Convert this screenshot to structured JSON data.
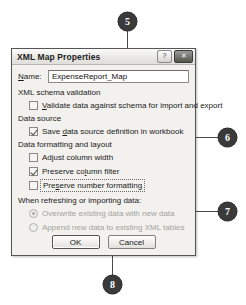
{
  "dialog": {
    "title": "XML Map Properties",
    "titlebar_buttons": [
      {
        "name": "help-button",
        "glyph": "?"
      },
      {
        "name": "close-button",
        "glyph": "✕"
      }
    ],
    "name_field": {
      "label": "Name:",
      "accel": "N",
      "label_rest": "ame:",
      "value": "ExpenseReport_Map",
      "placeholder": "Map name"
    },
    "groups": [
      {
        "label": "XML schema validation",
        "checkboxes": [
          {
            "label": "Validate data against schema for import and export",
            "accel": "V",
            "label_rest": "alidate data against schema for import and export",
            "checked": false,
            "focused": false,
            "disabled": false
          }
        ]
      },
      {
        "label": "Data source",
        "checkboxes": [
          {
            "label": "Save data source definition in workbook",
            "accel": "d",
            "label_pre": "Save ",
            "label_rest": "ata source definition in workbook",
            "checked": true,
            "focused": false,
            "disabled": false
          }
        ]
      },
      {
        "label": "Data formatting and layout",
        "checkboxes": [
          {
            "label": "Adjust column width",
            "accel": "j",
            "label_pre": "Ad",
            "label_rest": "ust column width",
            "checked": false,
            "focused": false,
            "disabled": false
          },
          {
            "label": "Preserve column filter",
            "accel": "l",
            "label_pre": "Preserve co",
            "label_rest": "umn filter",
            "checked": true,
            "focused": false,
            "disabled": false
          },
          {
            "label": "Preserve number formatting",
            "accel": "s",
            "label_pre": "Pre",
            "label_rest": "erve number formatting",
            "checked": false,
            "focused": true,
            "disabled": false
          }
        ]
      }
    ],
    "refresh_group": {
      "label": "When refreshing or importing data:",
      "options": [
        {
          "label": "Overwrite existing data with new data",
          "selected": true,
          "disabled": true
        },
        {
          "label": "Append new data to existing XML tables",
          "selected": false,
          "disabled": true
        }
      ]
    },
    "buttons": [
      {
        "label": "OK",
        "default": true
      },
      {
        "label": "Cancel",
        "default": false
      }
    ]
  },
  "callouts": [
    {
      "number": "5",
      "target": "name-field"
    },
    {
      "number": "6",
      "target": "options-groups"
    },
    {
      "number": "7",
      "target": "refresh-options"
    },
    {
      "number": "8",
      "target": "ok-button"
    }
  ],
  "colors": {
    "callout_fill": "#3a3a3a",
    "callout_text": "#ffffff",
    "dialog_face": "#f2f1ee",
    "dialog_border": "#555555",
    "leader_line": "#4a4a4a",
    "disabled_text": "#a3a19d"
  }
}
